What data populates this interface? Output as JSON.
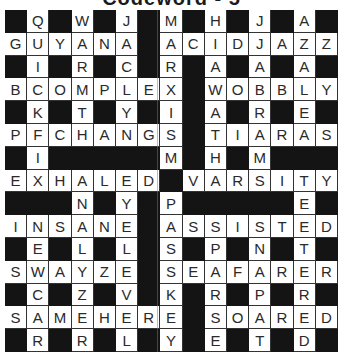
{
  "puzzle": {
    "title": "Codeword - 5",
    "columns": 15,
    "rows": 15,
    "colors": {
      "block": "#141414",
      "cell": "#ffffff",
      "letter": "#2a2a2a"
    },
    "grid": [
      "#Q#W#J#M#H#J#A#",
      "GUYANA#ACIDJAZZ",
      "#I#R#C#R#A#A#A#",
      "BCOMPLEX#WOBBLY",
      "#K#T#Y#I#A#R#E#",
      "PFCHANGS#TIARAS",
      "#I#####M#H#M###",
      "EXHALED#VARSITY",
      "###N#Y#P#####E#",
      "INSANE#ASSISTED",
      "#E#L#L#S#P#N#T#",
      "SWAYZE#SEAFARER",
      "#C#Z#V#K#R#P#R#",
      "SAMEHERE#SOARED",
      "#R#R#L#Y#E#T#D#"
    ],
    "across_words": [
      "GUYANA",
      "ACIDJAZZ",
      "BCOMPLEX",
      "WOBBLY",
      "PFCHANGS",
      "TIARAS",
      "EXHALED",
      "VARSITY",
      "INSANE",
      "ASSISTED",
      "SWAYZE",
      "SEAFARER",
      "SAMEHERE",
      "SOARED"
    ]
  }
}
